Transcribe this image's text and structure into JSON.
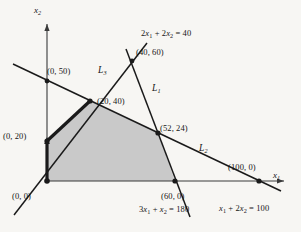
{
  "figure": {
    "type": "linear-programming-feasible-region",
    "background_color": "#f7f6f3",
    "line_color": "#1a1a1a",
    "region_fill": "#c9c9c9",
    "axes": {
      "x_label": "x1",
      "y_label": "x2",
      "x_label_html": "x<sub>1</sub>",
      "y_label_html": "x<sub>2</sub>"
    },
    "line_labels": [
      {
        "name": "L1",
        "html": "L<sub>1</sub>",
        "x": 152,
        "y": 84
      },
      {
        "name": "L2",
        "html": "L<sub>2</sub>",
        "x": 199,
        "y": 144
      },
      {
        "name": "L3",
        "html": "L<sub>3</sub>",
        "x": 98,
        "y": 66
      }
    ],
    "equations": [
      {
        "name": "eq-2x1-2x2-40",
        "html": "2x<sub>1</sub> + 2x<sub>2</sub> = 40",
        "x": 141,
        "y": 29
      },
      {
        "name": "eq-3x1-x2-180",
        "html": "3x<sub>1</sub> + x<sub>2</sub> = 180",
        "x": 139,
        "y": 205
      },
      {
        "name": "eq-x1-2x2-100",
        "html": "x<sub>1</sub> + 2x<sub>2</sub> = 100",
        "x": 219,
        "y": 204
      }
    ],
    "points": [
      {
        "name": "point-0-50",
        "label": "(0, 50)",
        "lx": 47,
        "ly": 67,
        "px": 47,
        "py": 81
      },
      {
        "name": "point-40-60",
        "label": "(40, 60)",
        "lx": 136,
        "ly": 48,
        "px": 132,
        "py": 61
      },
      {
        "name": "point-20-40",
        "label": "(20, 40)",
        "lx": 97,
        "ly": 97,
        "px": 90,
        "py": 101
      },
      {
        "name": "point-52-24",
        "label": "(52, 24)",
        "lx": 160,
        "ly": 124,
        "px": 158,
        "py": 133
      },
      {
        "name": "point-0-20",
        "label": "(0, 20)",
        "lx": 3,
        "ly": 132,
        "px": 47,
        "py": 141
      },
      {
        "name": "point-100-0",
        "label": "(100, 0)",
        "lx": 228,
        "ly": 163,
        "px": 259,
        "py": 181
      },
      {
        "name": "point-60-0",
        "label": "(60, 0)",
        "lx": 161,
        "ly": 192,
        "px": 175,
        "py": 181
      },
      {
        "name": "point-0-0",
        "label": "(0, 0)",
        "lx": 12,
        "ly": 192,
        "px": 47,
        "py": 181
      }
    ]
  }
}
